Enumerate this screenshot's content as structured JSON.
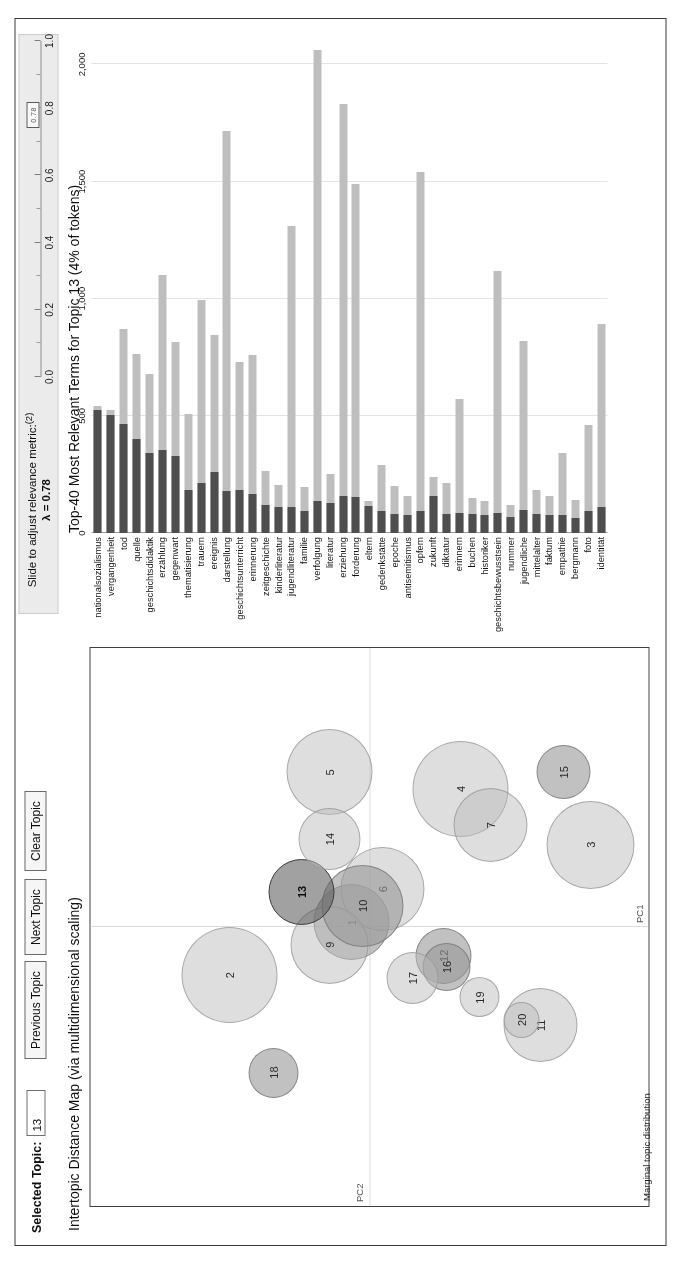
{
  "controls": {
    "selected_topic_label": "Selected Topic:",
    "selected_topic_value": "13",
    "previous_topic": "Previous Topic",
    "next_topic": "Next Topic",
    "clear_topic": "Clear Topic"
  },
  "slider": {
    "caption_line1": "Slide to adjust relevance metric:",
    "caption_superscript": "(2)",
    "lambda_label": "λ = 0.78",
    "value": 0.78,
    "handle_text": "0.78",
    "ticks": [
      0.0,
      0.2,
      0.4,
      0.6,
      0.8,
      1.0
    ],
    "tick_labels": [
      "0.0",
      "0.2",
      "0.4",
      "0.6",
      "0.8",
      "1.0"
    ],
    "minor_ticks": [
      0.1,
      0.3,
      0.5,
      0.7,
      0.9
    ]
  },
  "left_panel": {
    "title": "Intertopic Distance Map (via multidimensional scaling)",
    "axis_x_label": "PC1",
    "axis_y_label": "PC2",
    "marginal_caption": "Marginal topic distribution"
  },
  "right_panel": {
    "title": "Top-40 Most Relevant Terms for Topic 13 (4% of tokens)"
  },
  "chart_data": [
    {
      "type": "scatter",
      "title": "Intertopic Distance Map (via multidimensional scaling)",
      "xlabel": "PC1",
      "ylabel": "PC2",
      "grid": true,
      "legend": "none",
      "note": "Bubble area is proportional to marginal topic distribution; topic 13 is selected.",
      "points": [
        {
          "label": "1",
          "x": 0.02,
          "y": 0.06,
          "size": 76,
          "selected": false,
          "shade": "mid"
        },
        {
          "label": "2",
          "x": -0.17,
          "y": 0.5,
          "size": 96,
          "selected": false,
          "shade": "light"
        },
        {
          "label": "3",
          "x": 0.3,
          "y": -0.8,
          "size": 88,
          "selected": false,
          "shade": "light"
        },
        {
          "label": "4",
          "x": 0.5,
          "y": -0.33,
          "size": 96,
          "selected": false,
          "shade": "light"
        },
        {
          "label": "5",
          "x": 0.56,
          "y": 0.14,
          "size": 86,
          "selected": false,
          "shade": "light"
        },
        {
          "label": "6",
          "x": 0.14,
          "y": -0.05,
          "size": 84,
          "selected": false,
          "shade": "light"
        },
        {
          "label": "7",
          "x": 0.37,
          "y": -0.44,
          "size": 74,
          "selected": false,
          "shade": "light"
        },
        {
          "label": "9",
          "x": -0.06,
          "y": 0.14,
          "size": 78,
          "selected": false,
          "shade": "light"
        },
        {
          "label": "10",
          "x": 0.08,
          "y": 0.02,
          "size": 82,
          "selected": false,
          "shade": "mid"
        },
        {
          "label": "11",
          "x": -0.35,
          "y": -0.62,
          "size": 74,
          "selected": false,
          "shade": "light"
        },
        {
          "label": "12",
          "x": -0.1,
          "y": -0.27,
          "size": 56,
          "selected": false,
          "shade": "mid"
        },
        {
          "label": "13",
          "x": 0.13,
          "y": 0.24,
          "size": 66,
          "selected": true,
          "shade": "dark"
        },
        {
          "label": "14",
          "x": 0.32,
          "y": 0.14,
          "size": 62,
          "selected": false,
          "shade": "light"
        },
        {
          "label": "15",
          "x": 0.56,
          "y": -0.7,
          "size": 54,
          "selected": false,
          "shade": "mid"
        },
        {
          "label": "16",
          "x": -0.14,
          "y": -0.28,
          "size": 48,
          "selected": false,
          "shade": "mid"
        },
        {
          "label": "17",
          "x": -0.18,
          "y": -0.16,
          "size": 52,
          "selected": false,
          "shade": "light"
        },
        {
          "label": "18",
          "x": -0.52,
          "y": 0.34,
          "size": 50,
          "selected": false,
          "shade": "mid"
        },
        {
          "label": "19",
          "x": -0.25,
          "y": -0.4,
          "size": 40,
          "selected": false,
          "shade": "light"
        },
        {
          "label": "20",
          "x": -0.33,
          "y": -0.55,
          "size": 36,
          "selected": false,
          "shade": "light"
        }
      ]
    },
    {
      "type": "bar",
      "orientation": "horizontal",
      "title": "Top-40 Most Relevant Terms for Topic 13 (4% of tokens)",
      "xlabel": "",
      "ylabel": "",
      "xlim": [
        0,
        2100
      ],
      "xticks": [
        0,
        500,
        1000,
        1500,
        2000
      ],
      "xtick_labels": [
        "0",
        "500",
        "1,000",
        "1,500",
        "2,000"
      ],
      "grid": true,
      "series": [
        {
          "name": "Overall term frequency",
          "color": "#bdbdbd"
        },
        {
          "name": "Estimated term frequency within the selected topic",
          "color": "#4f4f4f"
        }
      ],
      "categories": [
        "nationalsozialismus",
        "vergangenheit",
        "tod",
        "quelle",
        "geschichtsdidaktik",
        "erzählung",
        "gegenwart",
        "thematisierung",
        "trauern",
        "ereignis",
        "darstellung",
        "geschichtsunterricht",
        "erinnerung",
        "zeitgeschichte",
        "kinderliteratur",
        "jugendliteratur",
        "familie",
        "verfolgung",
        "literatur",
        "erziehung",
        "forderung",
        "eltern",
        "gedenkstätte",
        "epoche",
        "antisemitismus",
        "opfern",
        "zukunft",
        "diktatur",
        "erinnern",
        "buchen",
        "historiker",
        "geschichtsbewusstsein",
        "nummer",
        "jugendliche",
        "mittelalter",
        "faktum",
        "empathie",
        "bergmann",
        "foto",
        "identität"
      ],
      "values_overall": [
        540,
        525,
        870,
        765,
        680,
        1100,
        815,
        510,
        995,
        845,
        1715,
        730,
        760,
        265,
        205,
        1310,
        195,
        2060,
        250,
        1830,
        1490,
        135,
        290,
        200,
        160,
        1540,
        240,
        215,
        570,
        150,
        135,
        1120,
        120,
        820,
        185,
        160,
        340,
        140,
        460,
        890
      ],
      "values_topic": [
        525,
        505,
        465,
        400,
        340,
        355,
        330,
        185,
        215,
        260,
        180,
        185,
        165,
        120,
        110,
        110,
        95,
        135,
        130,
        160,
        155,
        115,
        95,
        80,
        75,
        95,
        160,
        80,
        85,
        80,
        75,
        85,
        70,
        100,
        80,
        75,
        75,
        65,
        95,
        110
      ]
    }
  ]
}
